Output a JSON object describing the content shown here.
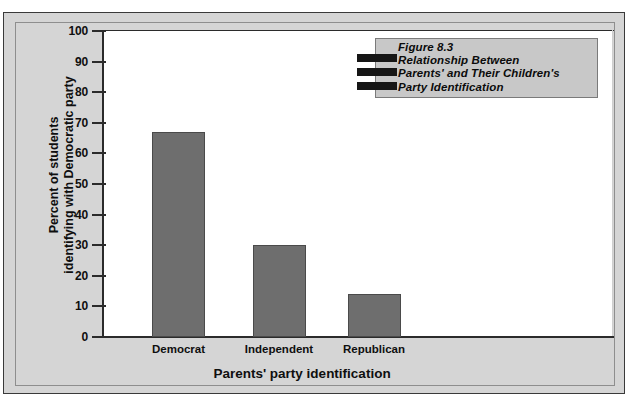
{
  "figure": {
    "title_lines": [
      "Figure 8.3",
      "Relationship Between",
      "Parents' and Their Children's",
      "Party Identification"
    ],
    "bar_color": "#6e6e6e",
    "background_color": "#d5d5d5",
    "plot_background_color": "#ffffff",
    "title_box_color": "#c8c8c8",
    "bottom_caption": ""
  },
  "chart_data": {
    "type": "bar",
    "categories": [
      "Democrat",
      "Independent",
      "Republican"
    ],
    "values": [
      67,
      30,
      14
    ],
    "xlabel": "Parents' party identification",
    "ylabel": "Percent of students\nidentifying with Democratic party",
    "ylim": [
      0,
      100
    ],
    "ytick_labels": [
      "100",
      "90",
      "80",
      "70",
      "60",
      "50",
      "40",
      "30",
      "20",
      "10",
      "0"
    ],
    "ytick_values": [
      100,
      90,
      80,
      70,
      60,
      50,
      40,
      30,
      20,
      10,
      0
    ],
    "grid": false,
    "legend": false
  }
}
